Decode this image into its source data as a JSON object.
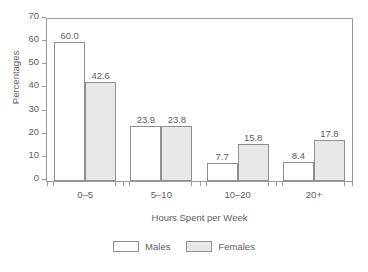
{
  "clipped_header_text": "",
  "chart_data": {
    "type": "bar",
    "title": "",
    "xlabel": "Hours Spent per Week",
    "ylabel": "Percentages",
    "categories": [
      "0–5",
      "5–10",
      "10–20",
      "20+"
    ],
    "series": [
      {
        "name": "Males",
        "color": "#ffffff",
        "values": [
          60.0,
          23.9,
          7.7,
          8.4
        ],
        "labels": [
          "60.0",
          "23.9",
          "7.7",
          "8.4"
        ]
      },
      {
        "name": "Females",
        "color": "#e8e8e8",
        "values": [
          42.6,
          23.8,
          15.8,
          17.8
        ],
        "labels": [
          "42.6",
          "23.8",
          "15.8",
          "17.8"
        ]
      }
    ],
    "ylim": [
      0,
      70
    ],
    "yticks": [
      0,
      10,
      20,
      30,
      40,
      50,
      60,
      70
    ],
    "ytick_labels": [
      "0",
      "10",
      "20",
      "30",
      "40",
      "50",
      "60",
      "70"
    ],
    "grid": false,
    "legend_position": "bottom-center",
    "axis_color": "#9a9a9a",
    "bar_border_color": "#8f8f8f",
    "text_color": "#5e5e5e"
  },
  "legend": {
    "entries": [
      {
        "label": "Males"
      },
      {
        "label": "Females"
      }
    ]
  }
}
